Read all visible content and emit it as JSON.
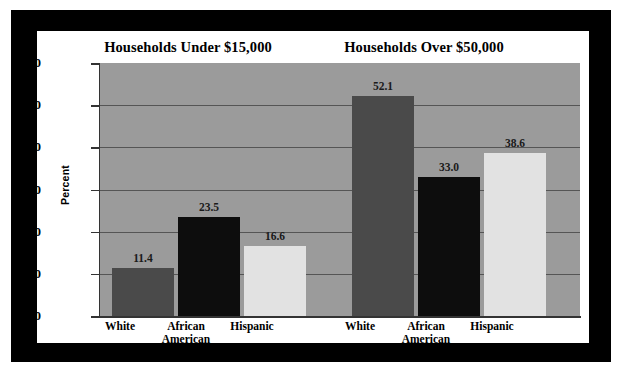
{
  "figure": {
    "frame_color": "#000000",
    "panel_color": "#ffffff",
    "plot_background": "#9b9b9b"
  },
  "axis": {
    "ylabel": "Percent",
    "yticks": [
      "60",
      "50",
      "40",
      "30",
      "20",
      "10",
      "0"
    ]
  },
  "chart_data": {
    "type": "bar",
    "panel_titles": [
      "Households Under $15,000",
      "Households Over $50,000"
    ],
    "xlabel": "",
    "ylabel": "Percent",
    "ylim": [
      0,
      60
    ],
    "ytick_values": [
      0,
      10,
      20,
      30,
      40,
      50,
      60
    ],
    "grid": true,
    "grid_axis": "y",
    "legend": "none",
    "categories": [
      "White",
      "African American",
      "Hispanic"
    ],
    "panels": [
      {
        "title": "Households Under $15,000",
        "categories": [
          "White",
          "African American",
          "Hispanic"
        ],
        "values": [
          11.4,
          23.5,
          16.6
        ],
        "labels": [
          "11.4",
          "23.5",
          "16.6"
        ],
        "colors": [
          "#4a4a4a",
          "#0d0d0d",
          "#e2e2e2"
        ]
      },
      {
        "title": "Households Over $50,000",
        "categories": [
          "White",
          "African American",
          "Hispanic"
        ],
        "values": [
          52.1,
          33.0,
          38.6
        ],
        "labels": [
          "52.1",
          "33.0",
          "38.6"
        ],
        "colors": [
          "#4a4a4a",
          "#0d0d0d",
          "#e2e2e2"
        ]
      }
    ],
    "series": [
      {
        "name": "Households Under $15,000",
        "values": [
          11.4,
          23.5,
          16.6
        ]
      },
      {
        "name": "Households Over $50,000",
        "values": [
          52.1,
          33.0,
          38.6
        ]
      }
    ]
  },
  "bars": [
    {
      "group": "under",
      "category": "White",
      "label": "11.4",
      "value": 11.4,
      "color": "#4a4a4a",
      "left": 12,
      "width": 62
    },
    {
      "group": "under",
      "category": "African American",
      "label": "23.5",
      "value": 23.5,
      "color": "#0d0d0d",
      "left": 78,
      "width": 62
    },
    {
      "group": "under",
      "category": "Hispanic",
      "label": "16.6",
      "value": 16.6,
      "color": "#e2e2e2",
      "left": 144,
      "width": 62
    },
    {
      "group": "over",
      "category": "White",
      "label": "52.1",
      "value": 52.1,
      "color": "#4a4a4a",
      "left": 252,
      "width": 62
    },
    {
      "group": "over",
      "category": "African American",
      "label": "33.0",
      "value": 33.0,
      "color": "#0d0d0d",
      "left": 318,
      "width": 62
    },
    {
      "group": "over",
      "category": "Hispanic",
      "label": "38.6",
      "value": 38.6,
      "color": "#e2e2e2",
      "left": 384,
      "width": 62
    }
  ],
  "cat_labels": [
    {
      "line1": "White",
      "line2": "",
      "left": 43,
      "width": 80
    },
    {
      "line1": "African",
      "line2": "American",
      "left": 109,
      "width": 80
    },
    {
      "line1": "Hispanic",
      "line2": "",
      "left": 175,
      "width": 80
    },
    {
      "line1": "White",
      "line2": "",
      "left": 283,
      "width": 80
    },
    {
      "line1": "African",
      "line2": "American",
      "left": 349,
      "width": 80
    },
    {
      "line1": "Hispanic",
      "line2": "",
      "left": 415,
      "width": 80
    }
  ]
}
